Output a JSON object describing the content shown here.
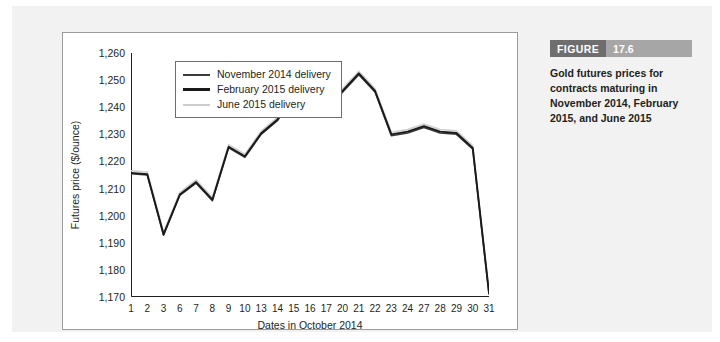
{
  "figure": {
    "label": "FIGURE",
    "number": "17.6",
    "caption": "Gold futures prices for contracts maturing in November 2014, February 2015, and June 2015"
  },
  "chart_data": {
    "type": "line",
    "title": "",
    "xlabel": "Dates in October 2014",
    "ylabel": "Futures price ($/ounce)",
    "xlim": [
      0,
      22
    ],
    "ylim": [
      1170,
      1260
    ],
    "ytick_labels": [
      "1,260",
      "1,250",
      "1,240",
      "1,230",
      "1,220",
      "1,210",
      "1,200",
      "1,190",
      "1,180",
      "1,170"
    ],
    "ytick_values": [
      1260,
      1250,
      1240,
      1230,
      1220,
      1210,
      1200,
      1190,
      1180,
      1170
    ],
    "grid": false,
    "legend_position": "upper-left",
    "categories": [
      "1",
      "2",
      "3",
      "6",
      "7",
      "8",
      "9",
      "10",
      "13",
      "14",
      "15",
      "16",
      "17",
      "20",
      "21",
      "22",
      "23",
      "24",
      "27",
      "28",
      "29",
      "30",
      "31"
    ],
    "series": [
      {
        "name": "November 2014 delivery",
        "color": "#3b3b3b",
        "values": [
          1215.5,
          1215.0,
          1192.8,
          1207.5,
          1212.0,
          1205.5,
          1225.0,
          1221.5,
          1230.0,
          1235.0,
          1244.5,
          1241.5,
          1239.0,
          1245.5,
          1252.0,
          1245.5,
          1229.5,
          1230.5,
          1232.5,
          1230.5,
          1230.0,
          1224.5,
          1171.0
        ]
      },
      {
        "name": "February 2015 delivery",
        "color": "#1a1a1a",
        "values": [
          1215.8,
          1215.3,
          1193.1,
          1207.8,
          1212.4,
          1205.9,
          1225.4,
          1221.9,
          1230.4,
          1235.5,
          1245.0,
          1242.0,
          1239.5,
          1246.0,
          1252.5,
          1246.0,
          1230.0,
          1231.0,
          1233.0,
          1231.0,
          1230.5,
          1225.0,
          1171.5
        ]
      },
      {
        "name": "June 2015 delivery",
        "color": "#cfcfcf",
        "values": [
          1216.6,
          1216.1,
          1193.9,
          1208.6,
          1213.2,
          1206.7,
          1226.2,
          1222.7,
          1231.2,
          1236.3,
          1245.8,
          1242.8,
          1240.3,
          1246.8,
          1253.3,
          1246.8,
          1230.8,
          1231.8,
          1233.8,
          1231.8,
          1231.3,
          1225.8,
          1172.3
        ]
      }
    ]
  }
}
